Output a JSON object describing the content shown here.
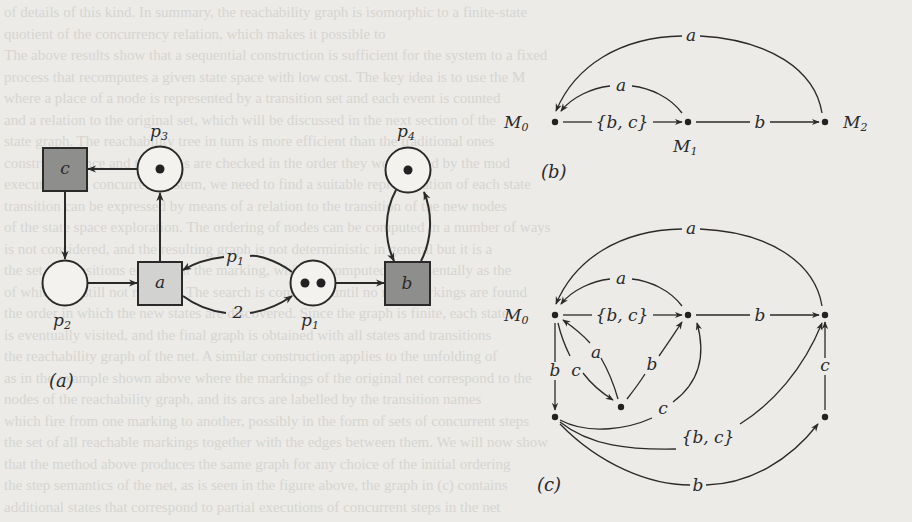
{
  "figure": {
    "panel_a": {
      "caption": "(a)",
      "places": [
        {
          "id": "p1",
          "label": "p",
          "sub": "1",
          "tokens": 2
        },
        {
          "id": "p2",
          "label": "p",
          "sub": "2",
          "tokens": 0
        },
        {
          "id": "p3",
          "label": "p",
          "sub": "3",
          "tokens": 1
        },
        {
          "id": "p4",
          "label": "p",
          "sub": "4",
          "tokens": 1
        }
      ],
      "transitions": [
        {
          "id": "a",
          "label": "a",
          "fill": "#d2d2d0"
        },
        {
          "id": "b",
          "label": "b",
          "fill": "#8e8e8c"
        },
        {
          "id": "c",
          "label": "c",
          "fill": "#8e8e8c"
        }
      ],
      "arc_labels": {
        "p1_to_a": "p1",
        "a_to_p1": "2"
      }
    },
    "panel_b": {
      "caption": "(b)",
      "nodes": [
        {
          "id": "M0",
          "label": "M",
          "sub": "0"
        },
        {
          "id": "M1",
          "label": "M",
          "sub": "1"
        },
        {
          "id": "M2",
          "label": "M",
          "sub": "2"
        }
      ],
      "edges": [
        {
          "from": "M0",
          "to": "M1",
          "label": "{b, c}"
        },
        {
          "from": "M1",
          "to": "M2",
          "label": "b"
        },
        {
          "from": "M1",
          "to": "M0",
          "label": "a"
        },
        {
          "from": "M2",
          "to": "M0",
          "label": "a"
        }
      ]
    },
    "panel_c": {
      "caption": "(c)",
      "root_label": "M",
      "root_sub": "0",
      "edges": [
        {
          "from": "M0",
          "to": "M1",
          "label": "{b, c}"
        },
        {
          "from": "M1",
          "to": "M2",
          "label": "b"
        },
        {
          "from": "M1",
          "to": "M0",
          "label": "a"
        },
        {
          "from": "M2",
          "to": "M0",
          "label": "a"
        },
        {
          "from": "M0",
          "to": "BL",
          "label": "b"
        },
        {
          "from": "M0",
          "to": "MID",
          "label": "c"
        },
        {
          "from": "MID",
          "to": "M0",
          "label": "a"
        },
        {
          "from": "MID",
          "to": "M1",
          "label": "b"
        },
        {
          "from": "BL",
          "to": "M1",
          "label": "c"
        },
        {
          "from": "BL",
          "to": "M2",
          "label": "{b, c}"
        },
        {
          "from": "BL",
          "to": "BR",
          "label": "b"
        },
        {
          "from": "BR",
          "to": "M2",
          "label": "c"
        }
      ]
    },
    "colors": {
      "background": "#ecebe8",
      "stroke": "#2a2a2a",
      "transition_dark": "#8e8e8c",
      "transition_light": "#d2d2d0"
    }
  },
  "bleed_text": [
    "of details of this kind. In summary, the reachability graph is isomorphic to a finite-state",
    "quotient of the concurrency relation, which makes it possible to",
    "The above results show that a sequential construction is sufficient for the system to a fixed",
    "process that recomputes a given state space with low cost. The key idea is to use the M",
    "where a place of a node is represented by a transition set and each event is counted",
    "and a relation to the original set, which will be discussed in the next section of the",
    "state graph. The reachability tree in turn is more efficient than the traditional ones",
    "constructed once and the states are checked in the order they were found by the mod",
    "execution of a concurrent system, we need to find a suitable representation of each state",
    "transition can be expressed by means of a relation to the transition of the new nodes",
    "of the state space exploration. The ordering of nodes can be computed in a number of ways",
    "is not considered, and the resulting graph is not deterministic in general but it is a",
    "the set of transitions enabled at the marking, which is computed incrementally as the",
    "of which are still not reached. The search is continued until no new markings are found",
    "the order in which the new states are discovered. Since the graph is finite, each state",
    "is eventually visited, and the final graph is obtained with all states and transitions",
    "the reachability graph of the net. A similar construction applies to the unfolding of",
    "as in the example shown above where the markings of the original net correspond to the",
    "nodes of the reachability graph, and its arcs are labelled by the transition names",
    "which fire from one marking to another, possibly in the form of sets of concurrent steps",
    "the set of all reachable markings together with the edges between them. We will now show",
    "that the method above produces the same graph for any choice of the initial ordering",
    "the step semantics of the net, as is seen in the figure above, the graph in (c) contains",
    "additional states that correspond to partial executions of concurrent steps in the net"
  ]
}
